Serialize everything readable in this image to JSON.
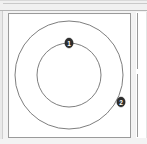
{
  "window": {
    "toolbar_present": true,
    "background_color": "#f3f3f3"
  },
  "canvas": {
    "title": "",
    "background_color": "#ffffff",
    "border_color": "#9a9a9a"
  },
  "diagram": {
    "type": "concentric-circles",
    "stroke_color": "#6f6f6f",
    "center": {
      "x": 62,
      "y": 62
    },
    "shapes": [
      {
        "name": "outer-circle",
        "radius": 58
      },
      {
        "name": "inner-circle",
        "radius": 35
      }
    ],
    "markers": [
      {
        "label": "1",
        "on_shape": "inner-circle",
        "angle_deg": 90,
        "x": 62,
        "y": 27,
        "fill": "#2e2e2e",
        "text_color": "#ffffff"
      },
      {
        "label": "2",
        "on_shape": "outer-circle",
        "angle_deg": 345,
        "x": 118,
        "y": 77,
        "fill": "#2e2e2e",
        "text_color": "#ffffff"
      }
    ]
  },
  "side_panel": {
    "divider_color": "#9a9a9a",
    "background_color": "#ffffff"
  }
}
